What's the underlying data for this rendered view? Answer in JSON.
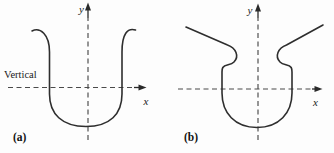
{
  "figure": {
    "background": "#fdfdfd",
    "colors": {
      "curve": "#2e2e2e",
      "axis": "#4a4a4a",
      "text": "#1a1a1a"
    },
    "panels": [
      {
        "caption": "(a)",
        "x_axis_label": "x",
        "y_axis_label": "y",
        "annotation": "Vertical",
        "curve_path": "M 32 31 C 40 27 49.5 34 49.5 52 L 49.5 94 C 49.5 114 62 126.5 86 126.5 C 110 126.5 122 114 122 94 L 122 52 C 122 34 127.5 27.5 135.5 30"
      },
      {
        "caption": "(b)",
        "x_axis_label": "x",
        "y_axis_label": "y",
        "annotation": "",
        "curve_path": "M 186 27 L 227.5 45 C 236 48 239.5 56.5 234 62 C 230.5 65.5 225 64 222.8 67.5 C 222.2 68.6 222 70 222 72 L 222 93 C 222 113 235 127.5 257 127.5 C 279 127.5 292 113 292 93 L 292 72 C 292 70 291.8 68.6 291.2 67.5 C 289 64 283.5 65.5 280 62 C 274.5 56.5 278 48 286.5 45 L 323 25"
      }
    ]
  }
}
